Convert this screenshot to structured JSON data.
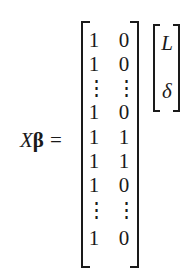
{
  "equation": {
    "lhs": {
      "symbol_x": "X",
      "symbol_beta": "β",
      "equals": "="
    },
    "matrix": {
      "rows": [
        [
          "1",
          "0"
        ],
        [
          "1",
          "0"
        ],
        [
          "⋮",
          "⋮"
        ],
        [
          "1",
          "0"
        ],
        [
          "1",
          "1"
        ],
        [
          "1",
          "1"
        ],
        [
          "1",
          "0"
        ],
        [
          "⋮",
          "⋮"
        ],
        [
          "1",
          "0"
        ]
      ]
    },
    "vector": {
      "entries": [
        "L",
        "δ"
      ]
    }
  }
}
